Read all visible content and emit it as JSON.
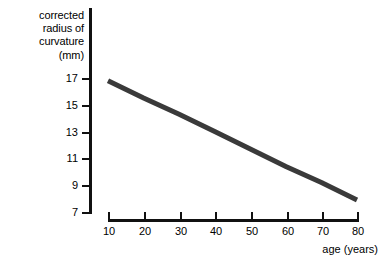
{
  "chart_data": {
    "type": "line",
    "title": "",
    "xlabel": "age (years)",
    "ylabel": "corrected radius of curvature (mm)",
    "ylabel_lines": [
      "corrected",
      "radius of",
      "curvature",
      "(mm)"
    ],
    "x": [
      10,
      80
    ],
    "values": [
      16.8,
      7.9
    ],
    "series": [
      {
        "name": "corrected radius of curvature",
        "x": [
          10,
          20,
          30,
          40,
          50,
          60,
          70,
          80
        ],
        "values": [
          16.8,
          15.5,
          14.3,
          13.0,
          11.7,
          10.4,
          9.2,
          7.9
        ],
        "color": "#3a3a3a"
      }
    ],
    "xlim": [
      10,
      80
    ],
    "ylim": [
      7,
      17
    ],
    "xticks": [
      10,
      20,
      30,
      40,
      50,
      60,
      70,
      80
    ],
    "yticks": [
      17,
      15,
      13,
      11,
      9,
      7
    ],
    "xtick_labels": [
      "10",
      "20",
      "30",
      "40",
      "50",
      "60",
      "70",
      "80"
    ],
    "ytick_labels": [
      "17",
      "15",
      "13",
      "11",
      "9",
      "7"
    ],
    "grid": false,
    "legend": "none",
    "annotations": []
  },
  "style": {
    "background": "#ffffff",
    "axis_color": "#111111",
    "line_color": "#3a3a3a",
    "text_color": "#000000"
  }
}
